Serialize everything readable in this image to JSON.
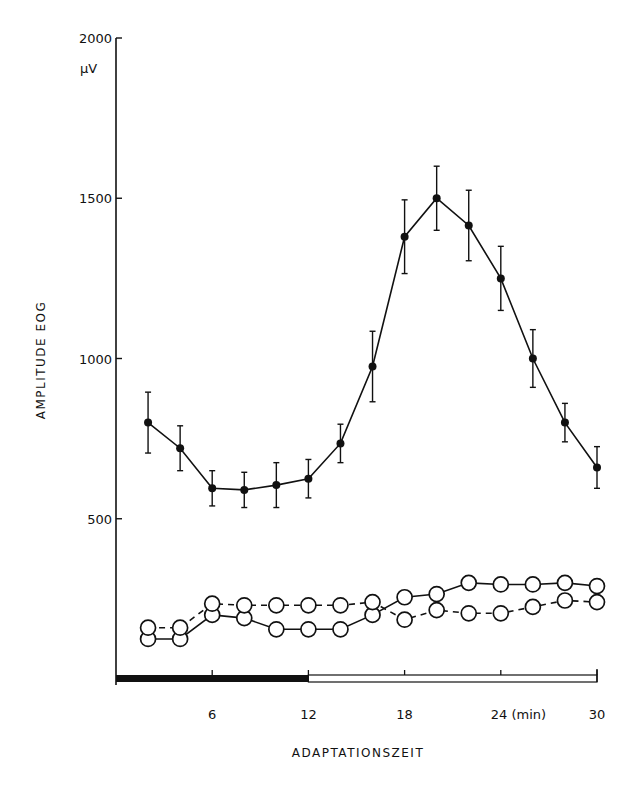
{
  "chart_data": {
    "type": "line",
    "title": "",
    "xlabel": "ADAPTATIONSZEIT",
    "ylabel": "AMPLITUDE EOG",
    "yunit": "µV",
    "xunit": "(min)",
    "xlim": [
      0,
      30
    ],
    "ylim": [
      0,
      2000
    ],
    "x_ticks": [
      6,
      12,
      18,
      24,
      30
    ],
    "x_tick_labels": [
      "6",
      "12",
      "18",
      "24 (min)",
      "30"
    ],
    "y_ticks": [
      500,
      1000,
      1500,
      2000
    ],
    "y_tick_labels": [
      "500",
      "1000",
      "1500",
      "2000"
    ],
    "grid": false,
    "legend": null,
    "dark_phase_bar": {
      "from": 0,
      "to": 12,
      "note": "black bar (dark) 0–12 min, white bar 12–30 min along x-axis"
    },
    "x": [
      2,
      4,
      6,
      8,
      10,
      12,
      14,
      16,
      18,
      20,
      22,
      24,
      26,
      28,
      30
    ],
    "series": [
      {
        "name": "filled-circles-solid",
        "marker": "filled-circle",
        "line": "solid",
        "values": [
          800,
          720,
          595,
          590,
          605,
          625,
          735,
          975,
          1380,
          1500,
          1415,
          1250,
          1000,
          800,
          660
        ],
        "error": [
          95,
          70,
          55,
          55,
          70,
          60,
          60,
          110,
          115,
          100,
          110,
          100,
          90,
          60,
          65
        ]
      },
      {
        "name": "open-circles-solid",
        "marker": "open-circle",
        "line": "solid",
        "values": [
          125,
          125,
          200,
          190,
          155,
          155,
          155,
          200,
          255,
          265,
          300,
          295,
          295,
          300,
          290
        ]
      },
      {
        "name": "open-circles-dashed",
        "marker": "open-circle",
        "line": "dashed",
        "values": [
          160,
          160,
          235,
          230,
          230,
          230,
          230,
          240,
          185,
          215,
          205,
          205,
          225,
          245,
          240
        ]
      }
    ]
  }
}
